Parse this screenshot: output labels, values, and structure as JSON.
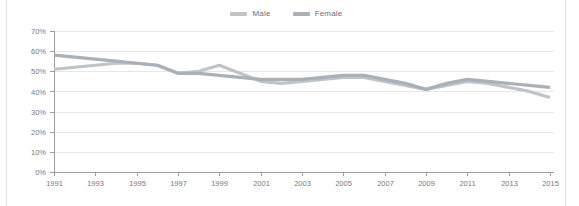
{
  "legend": {
    "position": "top-center",
    "items": [
      {
        "label": "Male",
        "color": "#bfc4c9",
        "icon": "line-swatch-icon"
      },
      {
        "label": "Female",
        "color": "#a9b0b8",
        "icon": "line-swatch-icon"
      }
    ]
  },
  "chart_data": {
    "type": "line",
    "title": "",
    "subtitle": "",
    "xlabel": "",
    "ylabel": "",
    "grid": true,
    "legend_position": "top-center",
    "ylim": [
      0,
      70
    ],
    "yticks": [
      0,
      10,
      20,
      30,
      40,
      50,
      60,
      70
    ],
    "ytick_labels": [
      "0%",
      "10%",
      "20%",
      "30%",
      "40%",
      "50%",
      "60%",
      "70%"
    ],
    "xlim": [
      1991,
      2015
    ],
    "x": [
      1991,
      1992,
      1993,
      1994,
      1995,
      1996,
      1997,
      1998,
      1999,
      2000,
      2001,
      2002,
      2003,
      2004,
      2005,
      2006,
      2007,
      2008,
      2009,
      2010,
      2011,
      2012,
      2013,
      2014,
      2015
    ],
    "xtick_labels": [
      "1991",
      "1993",
      "1995",
      "1997",
      "1999",
      "2001",
      "2003",
      "2005",
      "2007",
      "2009",
      "2011",
      "2013",
      "2015"
    ],
    "xticks": [
      1991,
      1993,
      1995,
      1997,
      1999,
      2001,
      2003,
      2005,
      2007,
      2009,
      2011,
      2013,
      2015
    ],
    "series": [
      {
        "name": "Male",
        "color": "#bfc4c9",
        "values": [
          51,
          52,
          53,
          54,
          54,
          53,
          49,
          50,
          53,
          49,
          45,
          44,
          45,
          46,
          47,
          47,
          45,
          43,
          41,
          43,
          45,
          44,
          42,
          40,
          37
        ]
      },
      {
        "name": "Female",
        "color": "#a9b0b8",
        "values": [
          58,
          57,
          56,
          55,
          54,
          53,
          49,
          49,
          48,
          47,
          46,
          46,
          46,
          47,
          48,
          48,
          46,
          44,
          41,
          44,
          46,
          45,
          44,
          43,
          42
        ]
      }
    ]
  }
}
